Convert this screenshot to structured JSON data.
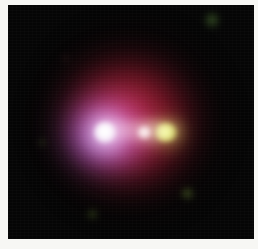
{
  "image": {
    "kind": "astronomical-false-color-image",
    "subject": "compact nebula with three bright knots along a linear jet",
    "background_color": "#050505",
    "page_background": "#f7f7f4",
    "plate": {
      "x": 8,
      "y": 5,
      "width": 246,
      "height": 234
    },
    "structures": [
      {
        "name": "red-halo",
        "label": "diffuse red nebular halo",
        "color": "#961a28",
        "center_x": 123,
        "center_y": 117,
        "radius_x": 105,
        "radius_y": 107
      },
      {
        "name": "blue-halo",
        "label": "blue-violet inner region",
        "color": "#7660ce",
        "center_x": 100,
        "center_y": 128,
        "radius_x": 58,
        "radius_y": 54
      },
      {
        "name": "jet-bridge",
        "label": "faint bridge linking knots",
        "color": "#ffe0e6",
        "x": 86,
        "y": 116,
        "width": 92,
        "height": 18
      }
    ],
    "knots": [
      {
        "id": "knot-a",
        "label": "west knot (white nucleus)",
        "color": "#ffffff",
        "center_x": 97,
        "center_y": 128,
        "size": 22
      },
      {
        "id": "knot-b",
        "label": "central knot (pink-white)",
        "color": "#fff7f3",
        "center_x": 136,
        "center_y": 128,
        "size": 15
      },
      {
        "id": "knot-c",
        "label": "east knot (yellow-green)",
        "color": "#e2f480",
        "center_x": 158,
        "center_y": 128,
        "size": 22
      }
    ],
    "specks": [
      {
        "id": "speck-top-right",
        "color": "#60963c",
        "center_x": 204,
        "center_y": 15
      },
      {
        "id": "speck-bottom-right",
        "color": "#80a43c",
        "center_x": 179,
        "center_y": 188
      },
      {
        "id": "speck-bottom-left",
        "color": "#688e2e",
        "center_x": 84,
        "center_y": 209
      },
      {
        "id": "speck-mid-left",
        "color": "#5c7e34",
        "center_x": 34,
        "center_y": 137
      },
      {
        "id": "speck-top-left",
        "color": "#783c3c",
        "center_x": 57,
        "center_y": 53
      }
    ]
  }
}
